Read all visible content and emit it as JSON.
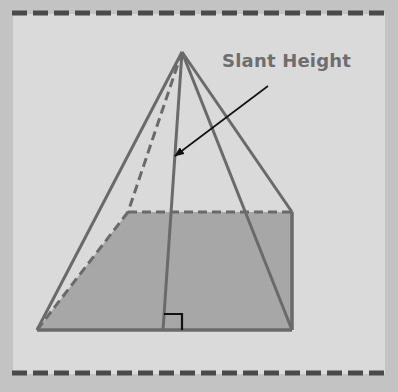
{
  "diagram": {
    "label_text": "Slant Height",
    "colors": {
      "outer_background": "#c3c3c3",
      "panel_background": "#dadada",
      "base_fill": "#a7a7a7",
      "edge_color": "#6a6a6a",
      "arrow_color": "#111111",
      "dash_border_color": "#4a4a4a",
      "label_color": "#6e6e6e"
    },
    "apex": [
      182,
      52
    ],
    "base": {
      "front_left": [
        37,
        330
      ],
      "front_right": [
        292,
        330
      ],
      "back_right": [
        292,
        212
      ],
      "back_left": [
        128,
        212
      ]
    },
    "slant_height_foot": [
      163,
      330
    ],
    "right_angle_marker": true,
    "arrow": {
      "from": [
        268,
        86
      ],
      "to": [
        173,
        157
      ]
    }
  }
}
